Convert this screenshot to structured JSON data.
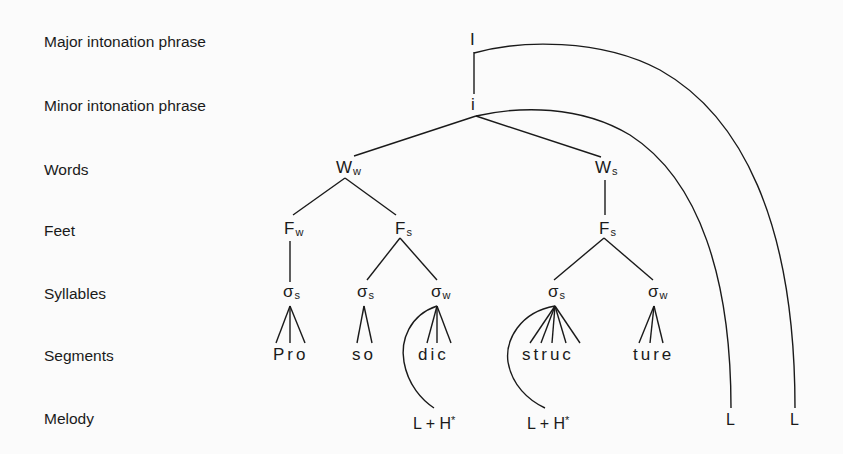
{
  "diagram": {
    "type": "prosodic-hierarchy-tree",
    "word": "Prosodic structure"
  },
  "rows": {
    "major": "Major intonation phrase",
    "minor": "Minor intonation phrase",
    "words": "Words",
    "feet": "Feet",
    "syllables": "Syllables",
    "segments": "Segments",
    "melody": "Melody"
  },
  "nodes": {
    "major_I": "I",
    "minor_i": "i",
    "word_weak": {
      "base": "W",
      "sub": "w"
    },
    "word_strong": {
      "base": "W",
      "sub": "s"
    },
    "foot_weak": {
      "base": "F",
      "sub": "w"
    },
    "foot_strong_1": {
      "base": "F",
      "sub": "s"
    },
    "foot_strong_2": {
      "base": "F",
      "sub": "s"
    },
    "syl_1": {
      "base": "σ",
      "sub": "s"
    },
    "syl_2": {
      "base": "σ",
      "sub": "s"
    },
    "syl_3": {
      "base": "σ",
      "sub": "w"
    },
    "syl_4": {
      "base": "σ",
      "sub": "s"
    },
    "syl_5": {
      "base": "σ",
      "sub": "w"
    }
  },
  "segments": [
    "Pro",
    "so",
    "dic",
    "struc",
    "ture"
  ],
  "melody": {
    "accent_1": {
      "main": "L + H",
      "star": "*"
    },
    "accent_2": {
      "main": "L + H",
      "star": "*"
    },
    "boundary_minor": "L",
    "boundary_major": "L"
  }
}
